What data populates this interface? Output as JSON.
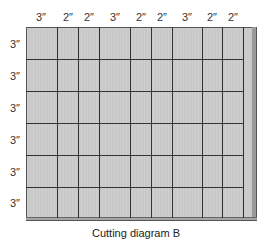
{
  "diagram": {
    "caption": "Cutting diagram B",
    "column_labels": [
      "3″",
      "2″",
      "2″",
      "3″",
      "2″",
      "2″",
      "3″",
      "2″",
      "2″"
    ],
    "row_labels": [
      "3″",
      "3″",
      "3″",
      "3″",
      "3″",
      "3″"
    ],
    "colors": {
      "board_fill": "#c8c8c8",
      "cut_lines": "#333333",
      "border": "#555555",
      "waste_strip": "#9a9a9a"
    }
  }
}
